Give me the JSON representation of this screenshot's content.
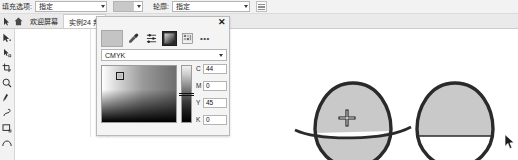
{
  "propbar": {
    "fill_label": "填充选项:",
    "fill_value": "指定",
    "outline_label": "轮廓:",
    "outline_value": "指定",
    "fill_swatch_color": "#c8c8c8",
    "dropdown_icon": "chevron-down-icon",
    "outline_width_icon": "outline-width-icon"
  },
  "tabs": {
    "nav_icon": "pointer-icon",
    "home_icon": "home-icon",
    "items": [
      {
        "label": "欢迎屏幕",
        "active": false
      },
      {
        "label": "实例24 邦",
        "active": true
      }
    ]
  },
  "toolbox": {
    "items": [
      {
        "name": "pick-tool",
        "icon": "arrow-pointer-icon"
      },
      {
        "name": "shape-tool",
        "icon": "node-edit-icon"
      },
      {
        "name": "crop-tool",
        "icon": "crop-icon"
      },
      {
        "name": "zoom-tool",
        "icon": "magnifier-icon"
      },
      {
        "name": "freehand-tool",
        "icon": "pen-icon"
      },
      {
        "name": "smart-fill-tool",
        "icon": "smart-fill-icon"
      },
      {
        "name": "rectangle-tool",
        "icon": "rectangle-icon"
      },
      {
        "name": "ellipse-tool",
        "icon": "ellipse-icon"
      }
    ]
  },
  "color_panel": {
    "close_label": "✕",
    "current_swatch": "#c4c4c4",
    "eyedropper_icon": "eyedropper-icon",
    "sliders_icon": "sliders-icon",
    "gradient_icon": "gradient-icon",
    "palette_icon": "palette-grid-icon",
    "more_label": "•••",
    "mode_value": "CMYK",
    "channels": [
      {
        "label": "C",
        "value": "44"
      },
      {
        "label": "M",
        "value": "0"
      },
      {
        "label": "Y",
        "value": "45"
      },
      {
        "label": "K",
        "value": "0"
      }
    ]
  },
  "canvas": {
    "shape_left": {
      "name": "egg-shape-with-curve",
      "fill": "#c9c9c9",
      "stroke": "#2a2a2a",
      "cursor": "crosshair-cursor"
    },
    "shape_right": {
      "name": "egg-shape-half-filled",
      "fill": "#c9c9c9",
      "stroke": "#2a2a2a",
      "cursor": "arrow-cursor"
    }
  }
}
